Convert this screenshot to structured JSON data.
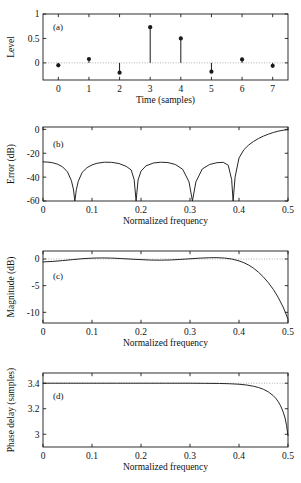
{
  "figure": {
    "background": "#ffffff",
    "line_color": "#1a1a1a",
    "dotted_color": "#9a9a9a",
    "panel_count": 4
  },
  "chart_data": [
    {
      "type": "stem",
      "panel": "a",
      "label": "(a)",
      "title": "",
      "xlabel": "Time (samples)",
      "ylabel": "Level",
      "xlim": [
        -0.5,
        7.5
      ],
      "ylim": [
        -0.35,
        1.0
      ],
      "xticks": [
        0,
        1,
        2,
        3,
        4,
        5,
        6,
        7
      ],
      "xticklabels": [
        "0",
        "1",
        "2",
        "3",
        "4",
        "5",
        "6",
        "7"
      ],
      "yticks": [
        0,
        0.5,
        1
      ],
      "yticklabels": [
        "0",
        "0.5",
        "1"
      ],
      "grid": false,
      "baseline": 0,
      "baseline_style": "dotted",
      "x": [
        0,
        1,
        2,
        3,
        4,
        5,
        6,
        7
      ],
      "values": [
        -0.05,
        0.08,
        -0.2,
        0.73,
        0.5,
        -0.18,
        0.07,
        -0.06
      ],
      "marker": "filled-circle"
    },
    {
      "type": "line",
      "panel": "b",
      "label": "(b)",
      "title": "",
      "xlabel": "Normalized frequency",
      "ylabel": "Error (dB)",
      "xlim": [
        0,
        0.5
      ],
      "ylim": [
        -60,
        2
      ],
      "xticks": [
        0,
        0.1,
        0.2,
        0.3,
        0.4,
        0.5
      ],
      "xticklabels": [
        "0",
        "0.1",
        "0.2",
        "0.3",
        "0.4",
        "0.5"
      ],
      "yticks": [
        0,
        -20,
        -40,
        -60
      ],
      "yticklabels": [
        "0",
        "-20",
        "-40",
        "-60"
      ],
      "grid": false,
      "nulls": [
        0.065,
        0.19,
        0.305,
        0.388
      ],
      "ripple_peaks_db": [
        -27,
        -27.5,
        -27.5,
        -28
      ],
      "x": [
        0,
        0.01,
        0.02,
        0.03,
        0.04,
        0.05,
        0.058,
        0.062,
        0.065,
        0.068,
        0.072,
        0.08,
        0.09,
        0.1,
        0.11,
        0.125,
        0.14,
        0.155,
        0.17,
        0.18,
        0.186,
        0.19,
        0.194,
        0.2,
        0.21,
        0.225,
        0.24,
        0.255,
        0.27,
        0.285,
        0.298,
        0.305,
        0.312,
        0.325,
        0.34,
        0.355,
        0.368,
        0.378,
        0.385,
        0.388,
        0.392,
        0.4,
        0.41,
        0.42,
        0.43,
        0.44,
        0.45,
        0.46,
        0.47,
        0.48,
        0.49,
        0.5
      ],
      "values": [
        -27.2,
        -27.4,
        -28.0,
        -29.2,
        -31.4,
        -35.6,
        -43.0,
        -50.0,
        -60.0,
        -50.5,
        -43.5,
        -36.0,
        -32.0,
        -29.8,
        -28.4,
        -27.5,
        -27.6,
        -28.6,
        -31.0,
        -34.0,
        -42.0,
        -60.0,
        -42.5,
        -35.0,
        -30.6,
        -28.2,
        -27.5,
        -27.8,
        -29.4,
        -33.4,
        -44.0,
        -60.0,
        -44.0,
        -33.2,
        -29.4,
        -27.9,
        -27.6,
        -30.0,
        -42.0,
        -60.0,
        -40.0,
        -24.0,
        -17.0,
        -13.0,
        -10.0,
        -7.6,
        -5.6,
        -4.0,
        -2.6,
        -1.5,
        -0.7,
        -0.2
      ]
    },
    {
      "type": "line",
      "panel": "c",
      "label": "(c)",
      "title": "",
      "xlabel": "Normalized frequency",
      "ylabel": "Magnitude (dB)",
      "xlim": [
        0,
        0.5
      ],
      "ylim": [
        -12,
        1.5
      ],
      "xticks": [
        0,
        0.1,
        0.2,
        0.3,
        0.4,
        0.5
      ],
      "xticklabels": [
        "0",
        "0.1",
        "0.2",
        "0.3",
        "0.4",
        "0.5"
      ],
      "yticks": [
        0,
        -5,
        -10
      ],
      "yticklabels": [
        "0",
        "-5",
        "-10"
      ],
      "grid": false,
      "reference_line": 0,
      "x": [
        0,
        0.02,
        0.04,
        0.06,
        0.08,
        0.1,
        0.12,
        0.14,
        0.16,
        0.18,
        0.2,
        0.22,
        0.24,
        0.26,
        0.28,
        0.3,
        0.32,
        0.34,
        0.355,
        0.37,
        0.385,
        0.4,
        0.41,
        0.42,
        0.43,
        0.44,
        0.45,
        0.46,
        0.47,
        0.48,
        0.49,
        0.495,
        0.5
      ],
      "values": [
        -0.55,
        -0.45,
        -0.3,
        -0.12,
        0.05,
        0.16,
        0.2,
        0.17,
        0.08,
        -0.02,
        -0.12,
        -0.2,
        -0.22,
        -0.18,
        -0.08,
        0.04,
        0.16,
        0.24,
        0.25,
        0.18,
        0.0,
        -0.35,
        -0.7,
        -1.15,
        -1.75,
        -2.5,
        -3.4,
        -4.45,
        -5.7,
        -7.2,
        -9.0,
        -10.1,
        -11.3
      ]
    },
    {
      "type": "line",
      "panel": "d",
      "label": "(d)",
      "title": "",
      "xlabel": "Normalized frequency",
      "ylabel": "Phase delay (samples)",
      "xlim": [
        0,
        0.5
      ],
      "ylim": [
        2.9,
        3.48
      ],
      "xticks": [
        0,
        0.1,
        0.2,
        0.3,
        0.4,
        0.5
      ],
      "xticklabels": [
        "0",
        "0.1",
        "0.2",
        "0.3",
        "0.4",
        "0.5"
      ],
      "yticks": [
        3,
        3.2,
        3.4
      ],
      "yticklabels": [
        "3",
        "3.2",
        "3.4"
      ],
      "grid": false,
      "reference_line": 3.4,
      "x": [
        0,
        0.05,
        0.1,
        0.15,
        0.2,
        0.25,
        0.3,
        0.33,
        0.36,
        0.38,
        0.4,
        0.415,
        0.43,
        0.44,
        0.45,
        0.46,
        0.47,
        0.475,
        0.48,
        0.485,
        0.49,
        0.494,
        0.497,
        0.5
      ],
      "values": [
        3.4,
        3.4,
        3.4,
        3.4,
        3.4,
        3.4,
        3.4,
        3.399,
        3.398,
        3.396,
        3.392,
        3.386,
        3.376,
        3.366,
        3.352,
        3.332,
        3.302,
        3.282,
        3.256,
        3.222,
        3.176,
        3.128,
        3.07,
        2.99
      ]
    }
  ]
}
